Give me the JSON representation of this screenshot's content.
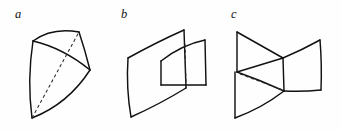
{
  "figure": {
    "background_color": "#fefefe",
    "stroke_color": "#111111",
    "dashed_stroke_color": "#2a2a2a",
    "width": 341,
    "height": 132,
    "panels": [
      {
        "label": "a",
        "label_x": 15,
        "label_y": 18,
        "description": "curved triangular surface with dashed diagonal"
      },
      {
        "label": "b",
        "label_x": 121,
        "label_y": 18,
        "description": "two intersecting curved quadrilateral sheets with dashed intersection line"
      },
      {
        "label": "c",
        "label_x": 231,
        "label_y": 18,
        "description": "bowtie saddle surface meeting curved sheet with dashed intersection line"
      }
    ]
  }
}
